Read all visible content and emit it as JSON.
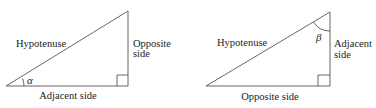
{
  "left_triangle": {
    "hypotenuse": "Hypotenuse",
    "opposite_line1": "Opposite",
    "opposite_line2": "side",
    "adjacent": "Adjacent side",
    "angle": "α"
  },
  "right_triangle": {
    "hypotenuse": "Hypotenuse",
    "adjacent_line1": "Adjacent",
    "adjacent_line2": "side",
    "opposite": "Opposite side",
    "angle": "β"
  },
  "colors": {
    "line": "#555555",
    "text": "#222222"
  }
}
